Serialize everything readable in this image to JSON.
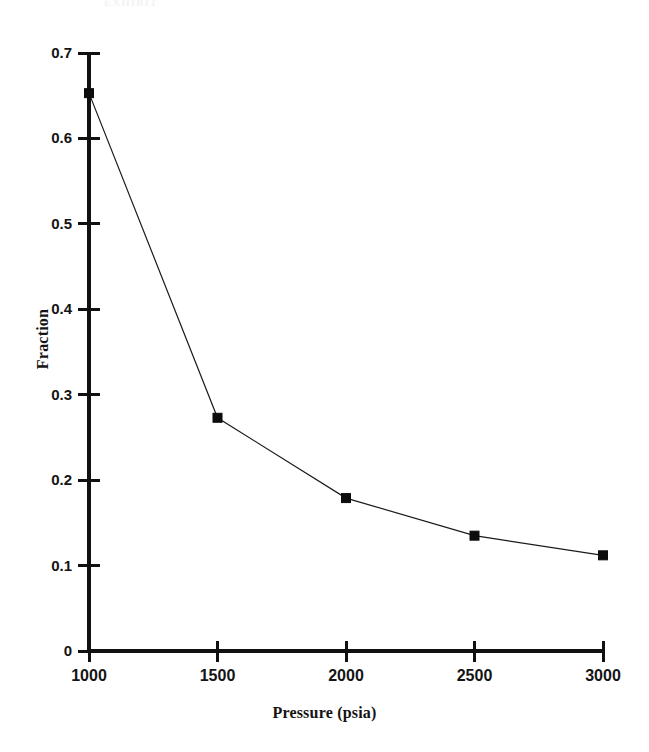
{
  "figure": {
    "background_color": "#ffffff",
    "ink_color": "#111111",
    "scan_artifact_text": "EXHIBIT"
  },
  "chart_data": {
    "type": "line",
    "title": "",
    "subtitle": "",
    "xlabel": "Pressure (psia)",
    "ylabel": "Fraction",
    "x": [
      1000,
      1500,
      2000,
      2500,
      3000
    ],
    "values": [
      0.653,
      0.273,
      0.179,
      0.135,
      0.112
    ],
    "series": [
      {
        "name": "Fraction",
        "x": [
          1000,
          1500,
          2000,
          2500,
          3000
        ],
        "values": [
          0.653,
          0.273,
          0.179,
          0.135,
          0.112
        ],
        "marker": "square",
        "color": "#0d0d0d"
      }
    ],
    "xlim": [
      1000,
      3000
    ],
    "ylim": [
      0,
      0.7
    ],
    "xticks": [
      1000,
      1500,
      2000,
      2500,
      3000
    ],
    "xtick_labels": [
      "1000",
      "1500",
      "2000",
      "2500",
      "3000"
    ],
    "yticks": [
      0,
      0.1,
      0.2,
      0.3,
      0.4,
      0.5,
      0.6,
      0.7
    ],
    "ytick_labels": [
      "0",
      "0.1",
      "0.2",
      "0.3",
      "0.4",
      "0.5",
      "0.6",
      "0.7"
    ],
    "grid": false,
    "legend": false,
    "legend_position": "none",
    "annotations": []
  }
}
